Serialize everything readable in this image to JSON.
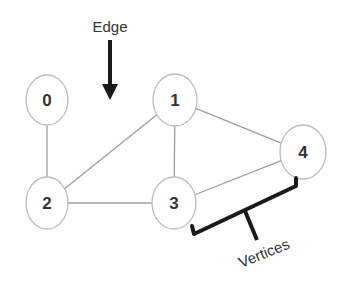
{
  "diagram": {
    "colors": {
      "background": "#ffffff",
      "node_stroke": "#bdbdbd",
      "edge_stroke": "#9e9e9e",
      "annotation": "#1a1a1a",
      "text": "#333333"
    },
    "nodes": [
      {
        "id": "0",
        "label": "0",
        "cx": 47,
        "cy": 100,
        "rx": 21,
        "ry": 25
      },
      {
        "id": "1",
        "label": "1",
        "cx": 175,
        "cy": 100,
        "rx": 22,
        "ry": 26
      },
      {
        "id": "2",
        "label": "2",
        "cx": 47,
        "cy": 203,
        "rx": 21,
        "ry": 26
      },
      {
        "id": "3",
        "label": "3",
        "cx": 174,
        "cy": 203,
        "rx": 22,
        "ry": 26
      },
      {
        "id": "4",
        "label": "4",
        "cx": 303,
        "cy": 152,
        "rx": 23,
        "ry": 27
      }
    ],
    "edges": [
      {
        "from": "0",
        "to": "2"
      },
      {
        "from": "1",
        "to": "2"
      },
      {
        "from": "1",
        "to": "3"
      },
      {
        "from": "1",
        "to": "4"
      },
      {
        "from": "2",
        "to": "3"
      },
      {
        "from": "3",
        "to": "4"
      }
    ],
    "annotations": {
      "edge_label": "Edge",
      "vertices_label": "Vertices"
    }
  }
}
